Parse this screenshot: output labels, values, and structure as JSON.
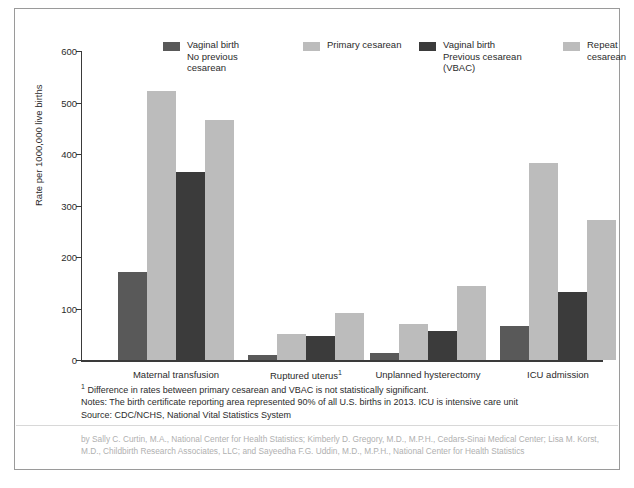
{
  "chart_data": {
    "type": "bar",
    "title": "",
    "xlabel": "",
    "ylabel": "Rate per 1000,000 live births",
    "ylim": [
      0,
      600
    ],
    "yticks": [
      0,
      100,
      200,
      300,
      400,
      500,
      600
    ],
    "grid": false,
    "legend_position": "top",
    "categories": [
      "Maternal transfusion",
      "Ruptured uterus¹",
      "Unplanned hysterectomy",
      "ICU admission"
    ],
    "series": [
      {
        "name": "Vaginal birth\nNo previous\ncesarean",
        "color": "#595959",
        "values": [
          170,
          10,
          14,
          67
        ]
      },
      {
        "name": "Primary cesarean",
        "color": "#bcbcbc",
        "values": [
          523,
          50,
          70,
          383
        ]
      },
      {
        "name": "Vaginal birth\nPrevious cesarean\n(VBAC)",
        "color": "#3b3b3b",
        "values": [
          366,
          47,
          56,
          132
        ]
      },
      {
        "name": "Repeat\ncesarean",
        "color": "#bcbcbc",
        "values": [
          467,
          92,
          144,
          271
        ]
      }
    ]
  },
  "notes": {
    "footnote_marker": "1",
    "footnote": "Difference in rates between primary cesarean and VBAC is not statistically significant.",
    "notes_line": "Notes: The birth certificate reporting area represented 90% of all U.S. births in 2013. ICU is intensive care unit",
    "source_line": "Source: CDC/NCHS, National Vital Statistics System"
  },
  "credit": {
    "text": "by Sally C. Curtin, M.A., National Center for Health Statistics; Kimberly D. Gregory, M.D., M.P.H., Cedars-Sinai Medical Center; Lisa M. Korst, M.D., Childbirth Research Associates, LLC; and Sayeedha F.G. Uddin, M.D., M.P.H., National Center for Health Statistics"
  }
}
